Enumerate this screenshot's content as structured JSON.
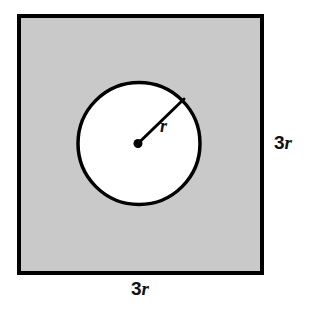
{
  "figure": {
    "background_color": "#ffffff"
  },
  "shapes": {
    "square": {
      "name": "outer-square",
      "fill_color": "#c9c9c9",
      "stroke_color": "#000000",
      "stroke_width": 4,
      "x": 17,
      "y": 14,
      "width": 247,
      "height": 261,
      "side_label": "3r"
    },
    "circle": {
      "name": "inner-circle",
      "fill_color": "#ffffff",
      "stroke_color": "#000000",
      "stroke_width": 3.5,
      "cx": 139,
      "cy": 143.5,
      "r": 61.5,
      "radius_label": "r"
    },
    "center_dot": {
      "name": "circle-center-point",
      "cx": 138,
      "cy": 143.5,
      "r": 4.5,
      "fill_color": "#000000"
    },
    "radius_line": {
      "name": "radius-segment",
      "x1": 138,
      "y1": 143.5,
      "x2": 184,
      "y2": 99,
      "stroke_color": "#000000",
      "stroke_width": 3
    }
  },
  "labels": {
    "right_side": {
      "digit": "3",
      "variable": "r",
      "full": "3r",
      "x": 274,
      "y": 149
    },
    "bottom_side": {
      "digit": "3",
      "variable": "r",
      "full": "3r",
      "x": 131,
      "y": 295
    },
    "radius": {
      "text": "r",
      "x": 160,
      "y": 132
    }
  }
}
